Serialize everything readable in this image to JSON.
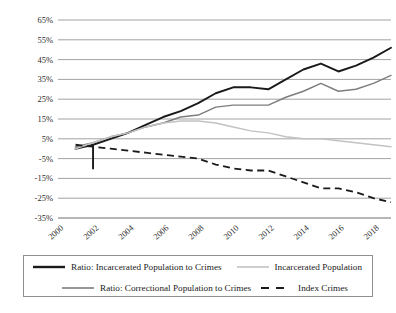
{
  "chart_data": {
    "type": "line",
    "title": "",
    "xlabel": "",
    "ylabel": "",
    "x": [
      2000,
      2001,
      2002,
      2003,
      2004,
      2005,
      2006,
      2007,
      2008,
      2009,
      2010,
      2011,
      2012,
      2013,
      2014,
      2015,
      2016,
      2017,
      2018,
      2019
    ],
    "xlim": [
      2000,
      2019
    ],
    "ylim": [
      -35,
      65
    ],
    "ytick_labels": [
      "65%",
      "55%",
      "45%",
      "35%",
      "25%",
      "15%",
      "5%",
      "-5%",
      "-15%",
      "-25%",
      "-35%"
    ],
    "ytick_values": [
      65,
      55,
      45,
      35,
      25,
      15,
      5,
      -5,
      -15,
      -25,
      -35
    ],
    "xtick_labels": [
      "2000",
      "2002",
      "2004",
      "2006",
      "2008",
      "2010",
      "2012",
      "2014",
      "2016",
      "2018"
    ],
    "xtick_values": [
      2000,
      2002,
      2004,
      2006,
      2008,
      2010,
      2012,
      2014,
      2016,
      2018
    ],
    "grid": true,
    "legend_position": "bottom",
    "series": [
      {
        "name": "Ratio: Incarcerated Population to Crimes",
        "style": "solid",
        "color": "#1a1a1a",
        "width": "thick",
        "x": [
          2001,
          2002,
          2002,
          2002,
          2003,
          2004,
          2005,
          2006,
          2007,
          2008,
          2009,
          2010,
          2011,
          2012,
          2013,
          2014,
          2015,
          2016,
          2017,
          2018,
          2019
        ],
        "values": [
          0,
          2,
          -10,
          2,
          5,
          8,
          12,
          16,
          19,
          23,
          28,
          31,
          31,
          30,
          35,
          40,
          43,
          39,
          42,
          46,
          51
        ]
      },
      {
        "name": "Ratio: Correctional Population to Crimes",
        "style": "solid",
        "color": "#7d7d7d",
        "width": "medium",
        "x": [
          2001,
          2002,
          2003,
          2004,
          2005,
          2006,
          2007,
          2008,
          2009,
          2010,
          2011,
          2012,
          2013,
          2014,
          2015,
          2016,
          2017,
          2018,
          2019
        ],
        "values": [
          1,
          3,
          6,
          8,
          11,
          13,
          16,
          17,
          21,
          22,
          22,
          22,
          26,
          29,
          33,
          29,
          30,
          33,
          37
        ]
      },
      {
        "name": "Incarcerated Population",
        "style": "solid",
        "color": "#c2c2c2",
        "width": "medium",
        "x": [
          2001,
          2002,
          2003,
          2004,
          2005,
          2006,
          2007,
          2008,
          2009,
          2010,
          2011,
          2012,
          2013,
          2014,
          2015,
          2016,
          2017,
          2018,
          2019
        ],
        "values": [
          0,
          3,
          6,
          8,
          11,
          13,
          14,
          14,
          13,
          11,
          9,
          8,
          6,
          5,
          5,
          4,
          3,
          2,
          1
        ]
      },
      {
        "name": "Index Crimes",
        "style": "dashed",
        "color": "#1a1a1a",
        "width": "medium",
        "x": [
          2001,
          2002,
          2003,
          2004,
          2005,
          2006,
          2007,
          2008,
          2009,
          2010,
          2011,
          2012,
          2013,
          2014,
          2015,
          2016,
          2017,
          2018,
          2019
        ],
        "values": [
          2,
          1,
          0,
          -1,
          -2,
          -3,
          -4,
          -5,
          -8,
          -10,
          -11,
          -11,
          -14,
          -17,
          -20,
          -20,
          -22,
          -25,
          -27
        ]
      }
    ]
  },
  "legend": {
    "items": [
      {
        "label": "Ratio: Incarcerated Population to Crimes",
        "swatch": "solid-thick-dark"
      },
      {
        "label": "Incarcerated Population",
        "swatch": "solid-light"
      },
      {
        "label": "Ratio: Correctional Population to Crimes",
        "swatch": "solid-mid"
      },
      {
        "label": "Index Crimes",
        "swatch": "dashed-dark"
      }
    ]
  },
  "caption": {
    "text": ""
  }
}
